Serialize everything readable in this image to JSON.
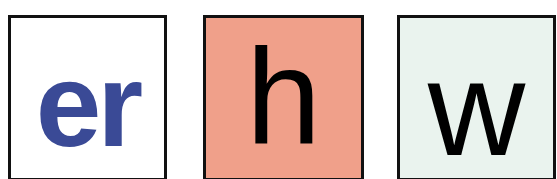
{
  "tiles": [
    {
      "text": "er",
      "background": "#ffffff",
      "color": "#3a4a96"
    },
    {
      "text": "h",
      "background": "#f0a08a",
      "color": "#000000"
    },
    {
      "text": "w",
      "background": "#eaf3ee",
      "color": "#000000"
    }
  ]
}
